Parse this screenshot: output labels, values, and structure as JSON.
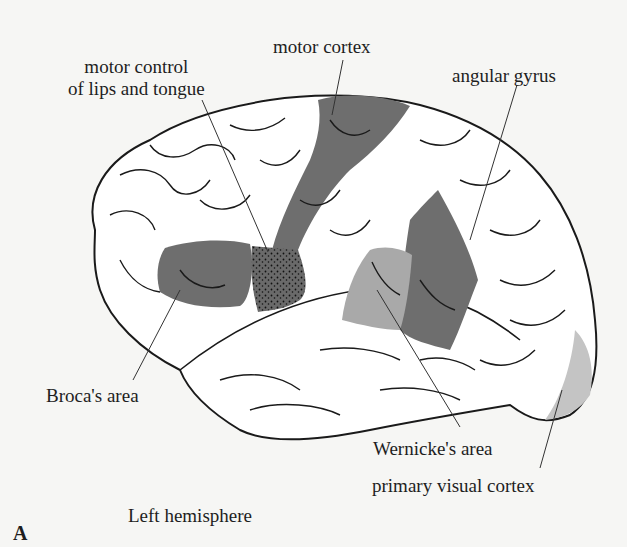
{
  "figure": {
    "panel_letter": "A",
    "caption": "Left hemisphere",
    "labels": {
      "motor_control": [
        "motor control",
        "of lips and tongue"
      ],
      "motor_cortex": "motor cortex",
      "angular_gyrus": "angular gyrus",
      "broca": "Broca's area",
      "wernicke": "Wernicke's area",
      "visual_cortex": "primary visual cortex"
    },
    "colors": {
      "background": "#f6f6f4",
      "brain_fill": "#ffffff",
      "outline": "#1a1a1a",
      "dark_region": "#6e6e6e",
      "light_region": "#a9a9a9",
      "visual_region": "#c4c4c4"
    }
  }
}
